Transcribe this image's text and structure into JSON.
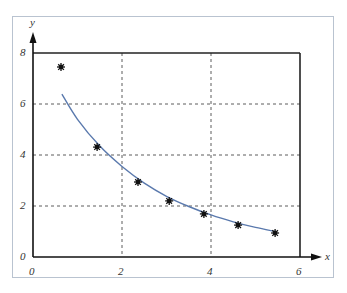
{
  "chart_data": {
    "type": "scatter",
    "title": "",
    "xlabel": "x",
    "ylabel": "y",
    "xlim": [
      0,
      6
    ],
    "ylim": [
      0,
      8
    ],
    "grid": true,
    "grid_style": "dashed",
    "x_ticks": [
      "0",
      "2",
      "4",
      "6"
    ],
    "y_ticks": [
      "0",
      "2",
      "4",
      "6",
      "8"
    ],
    "series": [
      {
        "name": "data points",
        "marker": "asterisk",
        "color": "#111111",
        "x": [
          0.63,
          1.44,
          2.36,
          3.06,
          3.84,
          4.61,
          5.44
        ],
        "y": [
          7.45,
          4.31,
          2.94,
          2.2,
          1.69,
          1.25,
          0.94
        ]
      },
      {
        "name": "fitted curve",
        "type": "line",
        "color": "#5a79ad",
        "x": [
          0.65,
          1.0,
          1.5,
          2.0,
          2.5,
          3.0,
          3.5,
          4.0,
          4.5,
          5.0,
          5.44
        ],
        "y": [
          6.39,
          5.4,
          4.35,
          3.55,
          2.9,
          2.38,
          1.98,
          1.65,
          1.38,
          1.16,
          1.0
        ]
      }
    ],
    "legend": null
  },
  "axes": {
    "x_label": "x",
    "y_label": "y",
    "x_tick_labels": [
      "0",
      "2",
      "4",
      "6"
    ],
    "y_tick_labels": [
      "0",
      "2",
      "4",
      "6",
      "8"
    ]
  }
}
